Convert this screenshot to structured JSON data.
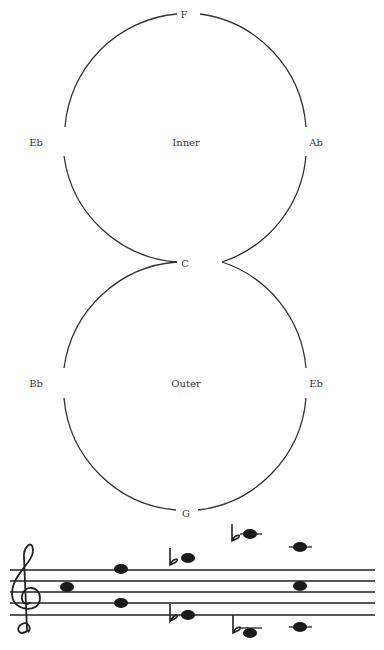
{
  "diagram": {
    "upper_circle": {
      "top_label": "F",
      "left_label": "Eb",
      "center_label": "Inner",
      "right_label": "Ab"
    },
    "junction_label": "C",
    "lower_circle": {
      "left_label": "Bb",
      "center_label": "Outer",
      "right_label": "Eb",
      "bottom_label": "G"
    }
  },
  "staff": {
    "clef": "treble",
    "notes": [
      {
        "pitch": "C5",
        "accidental": ""
      },
      {
        "pitch": "F5",
        "accidental": ""
      },
      {
        "pitch": "D5",
        "accidental": ""
      },
      {
        "pitch": "A5",
        "accidental": "flat"
      },
      {
        "pitch": "E4",
        "accidental": "flat"
      },
      {
        "pitch": "E6",
        "accidental": "flat"
      },
      {
        "pitch": "B3",
        "accidental": "flat"
      },
      {
        "pitch": "D6",
        "accidental": ""
      },
      {
        "pitch": "C5",
        "accidental": ""
      },
      {
        "pitch": "C4",
        "accidental": ""
      }
    ]
  }
}
